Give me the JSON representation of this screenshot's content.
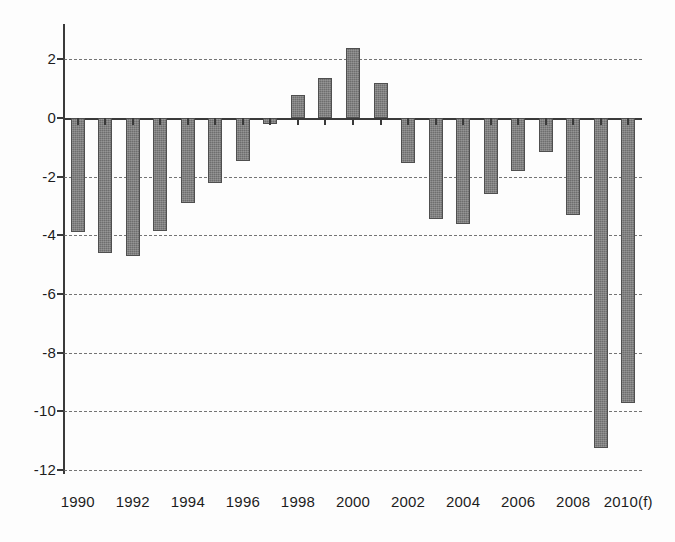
{
  "chart_data": {
    "type": "bar",
    "title": "",
    "subtitle": "",
    "xlabel": "",
    "ylabel": "",
    "categories": [
      "1990",
      "1991",
      "1992",
      "1993",
      "1994",
      "1995",
      "1996",
      "1997",
      "1998",
      "1999",
      "2000",
      "2001",
      "2002",
      "2003",
      "2004",
      "2005",
      "2006",
      "2007",
      "2008",
      "2009",
      "2010(f)"
    ],
    "values": [
      -3.9,
      -4.6,
      -4.7,
      -3.85,
      -2.9,
      -2.2,
      -1.45,
      -0.2,
      0.8,
      1.35,
      2.4,
      1.2,
      -1.55,
      -3.45,
      -3.6,
      -2.6,
      -1.8,
      -1.15,
      -3.3,
      -11.25,
      -9.7
    ],
    "ylim": [
      -12,
      3
    ],
    "yticks": [
      2,
      0,
      -2,
      -4,
      -6,
      -8,
      -10,
      -12
    ],
    "ytick_labels": [
      "2",
      "0",
      "-2",
      "-4",
      "-6",
      "-8",
      "-10",
      "-12"
    ],
    "xtick_labels": [
      "1990",
      "1992",
      "1994",
      "1996",
      "1998",
      "2000",
      "2002",
      "2004",
      "2006",
      "2008",
      "2010(f)"
    ],
    "grid": true,
    "grid_style": "dashed-horizontal",
    "legend": "none",
    "bar_color": "#6e6e6e",
    "axis_color": "#3a3a3a",
    "background_color": "#fdfdfd"
  }
}
